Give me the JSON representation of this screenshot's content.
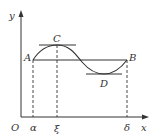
{
  "diagram": {
    "type": "function-graph",
    "axes": {
      "x_label": "x",
      "y_label": "y",
      "origin_label": "O"
    },
    "points": [
      {
        "name": "A",
        "label": "A"
      },
      {
        "name": "B",
        "label": "B"
      },
      {
        "name": "C",
        "label": "C"
      },
      {
        "name": "D",
        "label": "D"
      }
    ],
    "x_ticks": [
      {
        "name": "alpha",
        "label": "α"
      },
      {
        "name": "xi",
        "label": "ξ"
      },
      {
        "name": "delta",
        "label": "δ"
      }
    ],
    "colors": {
      "stroke": "#333333",
      "background": "#ffffff"
    }
  }
}
